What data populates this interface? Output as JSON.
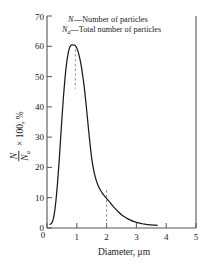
{
  "chart_data": {
    "type": "line",
    "title": "",
    "xlabel": "Diameter, μm",
    "ylabel_numerator": "N",
    "ylabel_denominator": "N",
    "ylabel_denominator_sub": "a",
    "ylabel_tail": "× 100, %",
    "xlim": [
      0,
      5
    ],
    "ylim": [
      0,
      70
    ],
    "xticks": [
      "0",
      "1",
      "2",
      "3",
      "4",
      "5"
    ],
    "xtick_values": [
      0,
      1,
      2,
      3,
      4,
      5
    ],
    "yticks": [
      "0",
      "10",
      "20",
      "30",
      "40",
      "50",
      "60",
      "70"
    ],
    "ytick_values": [
      0,
      10,
      20,
      30,
      40,
      50,
      60,
      70
    ],
    "grid": false,
    "legend_position": "top-right-inside",
    "series": [
      {
        "name": "particle size distribution",
        "color": "#1a1a1a",
        "x": [
          0.1,
          0.15,
          0.2,
          0.25,
          0.3,
          0.35,
          0.4,
          0.45,
          0.5,
          0.55,
          0.6,
          0.65,
          0.7,
          0.75,
          0.8,
          0.85,
          0.9,
          0.95,
          1.0,
          1.05,
          1.1,
          1.15,
          1.2,
          1.25,
          1.3,
          1.35,
          1.4,
          1.45,
          1.5,
          1.55,
          1.6,
          1.65,
          1.7,
          1.75,
          1.8,
          1.85,
          1.9,
          1.95,
          2.0,
          2.1,
          2.2,
          2.3,
          2.4,
          2.5,
          2.6,
          2.7,
          2.8,
          2.9,
          3.0,
          3.1,
          3.2,
          3.3,
          3.4,
          3.5,
          3.6,
          3.7
        ],
        "y": [
          1.2,
          1.5,
          2.6,
          5.0,
          9.0,
          14.5,
          21.0,
          28.5,
          36.0,
          43.0,
          49.0,
          53.8,
          57.2,
          59.3,
          60.3,
          60.5,
          60.4,
          60.2,
          59.4,
          58.0,
          56.0,
          53.5,
          50.2,
          46.5,
          42.0,
          37.0,
          32.0,
          27.2,
          23.0,
          20.0,
          17.6,
          15.8,
          14.4,
          13.3,
          12.4,
          11.6,
          10.9,
          10.3,
          9.8,
          8.6,
          7.4,
          6.3,
          5.3,
          4.4,
          3.7,
          3.1,
          2.6,
          2.2,
          1.9,
          1.6,
          1.4,
          1.25,
          1.1,
          1.0,
          0.95,
          0.9
        ]
      }
    ],
    "annotations": [
      {
        "name": "peak-marker",
        "type": "vertical-dashed",
        "x": 0.95,
        "y_top": 59.0,
        "y_bottom": 46.0,
        "color": "#8a8a8a"
      },
      {
        "name": "threshold-marker",
        "type": "vertical-dashed",
        "x": 2.0,
        "y_top": 12.5,
        "y_bottom": 0.0,
        "color": "#8a8a8a"
      }
    ],
    "legend": [
      {
        "symbol": "N",
        "sub": "",
        "text": "—Number of particles"
      },
      {
        "symbol": "N",
        "sub": "a",
        "text": "—Total number of particles"
      }
    ]
  }
}
